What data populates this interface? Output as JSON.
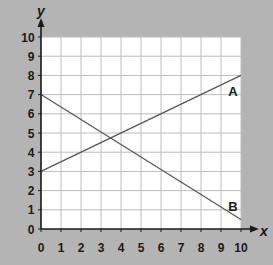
{
  "chart_data": {
    "type": "line",
    "title": "",
    "xlabel": "x",
    "ylabel": "y",
    "xlim": [
      0,
      10
    ],
    "ylim": [
      0,
      10
    ],
    "grid": true,
    "x_ticks": [
      0,
      1,
      2,
      3,
      4,
      5,
      6,
      7,
      8,
      9,
      10
    ],
    "y_ticks": [
      0,
      1,
      2,
      3,
      4,
      5,
      6,
      7,
      8,
      9,
      10
    ],
    "series": [
      {
        "name": "A",
        "x": [
          0,
          10
        ],
        "y": [
          3,
          8
        ]
      },
      {
        "name": "B",
        "x": [
          0,
          10
        ],
        "y": [
          7,
          0.5
        ]
      }
    ],
    "annotations": [
      {
        "text": "A",
        "x": 9.6,
        "y": 7.2
      },
      {
        "text": "B",
        "x": 9.6,
        "y": 1.2
      }
    ],
    "colors": {
      "background": "#b4b4b4",
      "plot_area": "#ffffff",
      "grid": "#bdbdbd",
      "lines": "#555555",
      "axes": "#1a1a1a"
    }
  },
  "axes": {
    "x_label": "x",
    "y_label": "y"
  },
  "labels": {
    "A": "A",
    "B": "B"
  }
}
